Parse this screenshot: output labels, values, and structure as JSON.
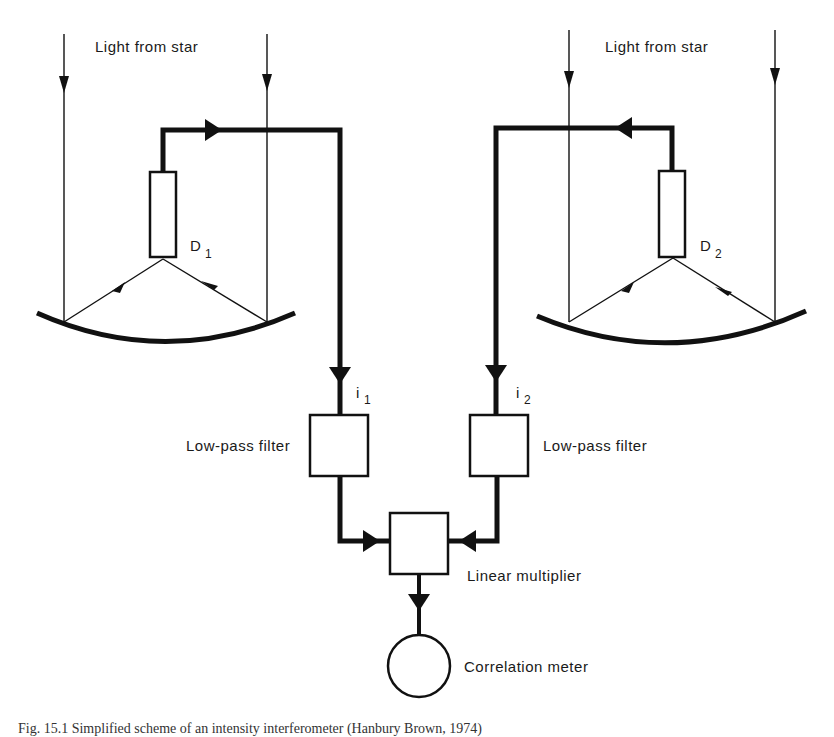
{
  "diagram": {
    "title": "Simplified scheme of an intensity interferometer",
    "left_telescope": {
      "light_label": "Light from star",
      "detector_label": "D",
      "detector_subscript": "1",
      "current_label": "i",
      "current_subscript": "1",
      "filter_label": "Low-pass filter"
    },
    "right_telescope": {
      "light_label": "Light from star",
      "detector_label": "D",
      "detector_subscript": "2",
      "current_label": "i",
      "current_subscript": "2",
      "filter_label": "Low-pass filter"
    },
    "multiplier_label": "Linear multiplier",
    "meter_label": "Correlation meter",
    "caption": "Fig. 15.1  Simplified scheme of an intensity interferometer (Hanbury Brown, 1974)",
    "colors": {
      "ink": "#111111",
      "background": "#ffffff"
    }
  }
}
